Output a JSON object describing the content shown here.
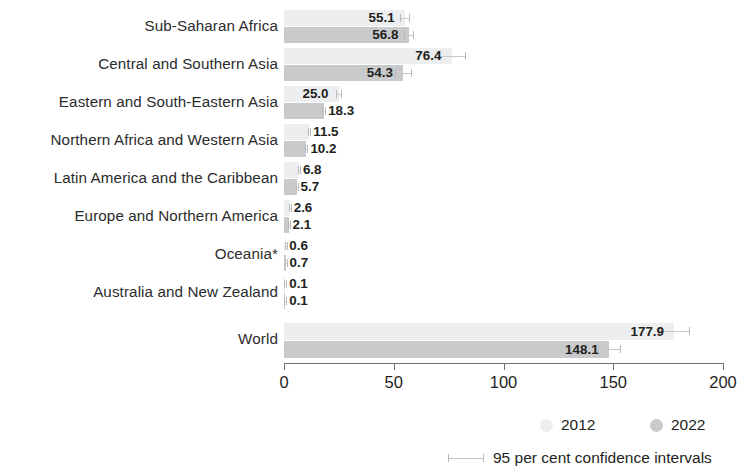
{
  "chart_data": {
    "type": "bar",
    "title": "",
    "xlabel": "",
    "ylabel": "",
    "orientation": "horizontal",
    "xlim": [
      0,
      200
    ],
    "tick_values": [
      0,
      50,
      100,
      150,
      200
    ],
    "tick_labels": [
      "0",
      "50",
      "100",
      "150",
      "200"
    ],
    "grid": false,
    "legend_position": "bottom-right",
    "categories": [
      "Sub-Saharan Africa",
      "Central and Southern Asia",
      "Eastern and South-Eastern Asia",
      "Northern Africa and Western Asia",
      "Latin America and the Caribbean",
      "Europe and Northern America",
      "Oceania*",
      "Australia and New Zealand",
      "World"
    ],
    "series": [
      {
        "name": "2012",
        "color": "#edeef0",
        "values": [
          55.1,
          76.4,
          25.0,
          11.5,
          6.8,
          2.6,
          0.6,
          0.1,
          177.9
        ],
        "labels": [
          "55.1",
          "76.4",
          "25.0",
          "11.5",
          "6.8",
          "2.6",
          "0.6",
          "0.1",
          "177.9"
        ],
        "ci_low": [
          53.0,
          70.0,
          23.8,
          10.9,
          6.4,
          2.5,
          0.5,
          0.1,
          171.0
        ],
        "ci_high": [
          57.3,
          83.0,
          26.3,
          12.1,
          7.2,
          2.7,
          0.7,
          0.1,
          185.0
        ]
      },
      {
        "name": "2022",
        "color": "#c8cacc",
        "values": [
          56.8,
          54.3,
          18.3,
          10.2,
          5.7,
          2.1,
          0.7,
          0.1,
          148.1
        ],
        "labels": [
          "56.8",
          "54.3",
          "18.3",
          "10.2",
          "5.7",
          "2.1",
          "0.7",
          "0.1",
          "148.1"
        ],
        "ci_low": [
          54.6,
          50.6,
          17.4,
          9.7,
          5.4,
          2.0,
          0.6,
          0.1,
          143.0
        ],
        "ci_high": [
          59.1,
          58.2,
          19.3,
          10.8,
          6.1,
          2.2,
          0.8,
          0.1,
          153.5
        ]
      }
    ],
    "annotations": [
      "95 per cent confidence intervals"
    ]
  },
  "legend": {
    "series": [
      {
        "label": "2012",
        "color": "#edeef0"
      },
      {
        "label": "2022",
        "color": "#c8cacc"
      }
    ],
    "ci_label": "95 per cent confidence intervals"
  }
}
